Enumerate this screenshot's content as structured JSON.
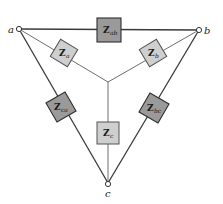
{
  "diagram": {
    "type": "delta-wye impedance network",
    "nodes": [
      {
        "id": "a",
        "label": "a"
      },
      {
        "id": "b",
        "label": "b"
      },
      {
        "id": "c",
        "label": "c"
      }
    ],
    "delta_impedances": [
      {
        "id": "Zab",
        "main": "Z",
        "sub": "ab",
        "between": [
          "a",
          "b"
        ]
      },
      {
        "id": "Zbc",
        "main": "Z",
        "sub": "bc",
        "between": [
          "b",
          "c"
        ]
      },
      {
        "id": "Zca",
        "main": "Z",
        "sub": "ca",
        "between": [
          "c",
          "a"
        ]
      }
    ],
    "wye_impedances": [
      {
        "id": "Za",
        "main": "Z",
        "sub": "a",
        "between": [
          "a",
          "center"
        ]
      },
      {
        "id": "Zb",
        "main": "Z",
        "sub": "b",
        "between": [
          "b",
          "center"
        ]
      },
      {
        "id": "Zc",
        "main": "Z",
        "sub": "c",
        "between": [
          "c",
          "center"
        ]
      }
    ],
    "colors": {
      "delta_box": "#9a9a9a",
      "wye_box": "#cfcfcf",
      "wire": "#3a3a3a"
    }
  }
}
